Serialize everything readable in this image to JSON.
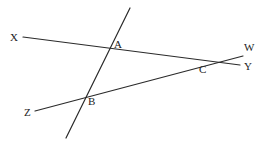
{
  "diagram": {
    "type": "geometry-lines",
    "colors": {
      "line": "#2a2a2a",
      "label": "#222222",
      "background": "#ffffff"
    },
    "lines": [
      {
        "id": "XY",
        "x1": 23,
        "y1": 37,
        "x2": 240,
        "y2": 65
      },
      {
        "id": "ZW",
        "x1": 35,
        "y1": 111,
        "x2": 243,
        "y2": 56
      },
      {
        "id": "AB",
        "x1": 130,
        "y1": 8,
        "x2": 66,
        "y2": 138
      }
    ],
    "labels": {
      "X": {
        "text": "X",
        "x": 10,
        "y": 41
      },
      "Y": {
        "text": "Y",
        "x": 244,
        "y": 70
      },
      "Z": {
        "text": "Z",
        "x": 24,
        "y": 116
      },
      "W": {
        "text": "W",
        "x": 244,
        "y": 51
      },
      "A": {
        "text": "A",
        "x": 114,
        "y": 48
      },
      "B": {
        "text": "B",
        "x": 88,
        "y": 105
      },
      "C": {
        "text": "C",
        "x": 199,
        "y": 73
      }
    }
  }
}
